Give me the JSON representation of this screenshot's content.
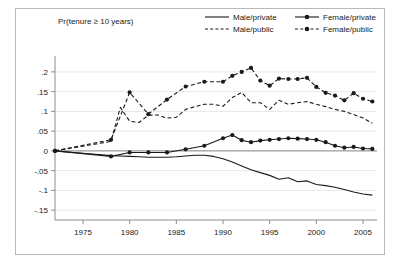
{
  "chart_data": {
    "type": "line",
    "title": "Pr(tenure ≥ 10 years)",
    "xlabel": "",
    "ylabel": "",
    "xlim": [
      1972,
      2006.5
    ],
    "ylim": [
      -0.175,
      0.225
    ],
    "xticks": [
      1975,
      1980,
      1985,
      1990,
      1995,
      2000,
      2005
    ],
    "xticklabels": [
      "1975",
      "1980",
      "1985",
      "1990",
      "1995",
      "2000",
      "2005"
    ],
    "yticks": [
      -0.15,
      -0.1,
      -0.05,
      0,
      0.05,
      0.1,
      0.15,
      0.2
    ],
    "yticklabels": [
      "-.15",
      "-.1",
      "-.05",
      "0",
      ".05",
      ".1",
      ".15",
      ".2"
    ],
    "grid": true,
    "grid_axis": "y",
    "legend_position": "top-right",
    "legend": [
      {
        "name": "Male/private",
        "style": "solid",
        "marker": "none"
      },
      {
        "name": "Female/private",
        "style": "solid",
        "marker": "circle"
      },
      {
        "name": "Male/public",
        "style": "dashed",
        "marker": "none"
      },
      {
        "name": "Female/public",
        "style": "dashed",
        "marker": "circle"
      }
    ],
    "series": [
      {
        "name": "Male/private",
        "style": "solid",
        "marker": "none",
        "x": [
          1972,
          1974,
          1976,
          1978,
          1979,
          1980,
          1981,
          1982,
          1983,
          1984,
          1985,
          1986,
          1987,
          1988,
          1989,
          1990,
          1991,
          1992,
          1993,
          1994,
          1995,
          1996,
          1997,
          1998,
          1999,
          2000,
          2001,
          2002,
          2003,
          2004,
          2005,
          2006
        ],
        "y": [
          0.0,
          -0.004,
          -0.008,
          -0.012,
          -0.013,
          -0.014,
          -0.015,
          -0.016,
          -0.016,
          -0.016,
          -0.015,
          -0.013,
          -0.011,
          -0.011,
          -0.014,
          -0.02,
          -0.028,
          -0.038,
          -0.048,
          -0.055,
          -0.062,
          -0.072,
          -0.068,
          -0.078,
          -0.076,
          -0.085,
          -0.088,
          -0.092,
          -0.098,
          -0.104,
          -0.109,
          -0.112
        ]
      },
      {
        "name": "Male/public",
        "style": "dashed",
        "marker": "none",
        "x": [
          1972,
          1974,
          1976,
          1978,
          1979,
          1980,
          1981,
          1982,
          1983,
          1984,
          1985,
          1986,
          1987,
          1988,
          1989,
          1990,
          1991,
          1992,
          1993,
          1994,
          1995,
          1996,
          1997,
          1998,
          1999,
          2000,
          2001,
          2002,
          2003,
          2004,
          2005,
          2006
        ],
        "y": [
          0.0,
          0.008,
          0.016,
          0.024,
          0.11,
          0.075,
          0.072,
          0.09,
          0.091,
          0.083,
          0.085,
          0.105,
          0.112,
          0.118,
          0.118,
          0.113,
          0.135,
          0.148,
          0.122,
          0.122,
          0.105,
          0.128,
          0.118,
          0.122,
          0.125,
          0.118,
          0.112,
          0.105,
          0.1,
          0.092,
          0.083,
          0.07
        ]
      },
      {
        "name": "Female/private",
        "style": "solid",
        "marker": "circle",
        "x": [
          1972,
          1978,
          1980,
          1982,
          1984,
          1986,
          1988,
          1990,
          1991,
          1992,
          1993,
          1994,
          1995,
          1996,
          1997,
          1998,
          1999,
          2000,
          2001,
          2002,
          2003,
          2004,
          2005,
          2006
        ],
        "y": [
          0.0,
          -0.014,
          -0.004,
          -0.004,
          -0.004,
          0.004,
          0.013,
          0.032,
          0.04,
          0.027,
          0.022,
          0.026,
          0.028,
          0.03,
          0.032,
          0.031,
          0.03,
          0.028,
          0.022,
          0.013,
          0.008,
          0.01,
          0.006,
          0.005
        ]
      },
      {
        "name": "Female/public",
        "style": "dashed",
        "marker": "circle",
        "x": [
          1972,
          1978,
          1980,
          1982,
          1984,
          1986,
          1988,
          1990,
          1991,
          1992,
          1993,
          1994,
          1995,
          1996,
          1997,
          1998,
          1999,
          2000,
          2001,
          2002,
          2003,
          2004,
          2005,
          2006
        ],
        "y": [
          0.0,
          0.028,
          0.148,
          0.093,
          0.13,
          0.163,
          0.175,
          0.175,
          0.19,
          0.2,
          0.21,
          0.178,
          0.165,
          0.183,
          0.182,
          0.182,
          0.185,
          0.162,
          0.147,
          0.14,
          0.128,
          0.146,
          0.132,
          0.125
        ]
      }
    ]
  },
  "colors": {
    "line": "#1a1a1a",
    "grid": "#e8e8e8",
    "axis": "#8c8c8c",
    "frame": "#b9b9b9",
    "background": "#ffffff"
  }
}
